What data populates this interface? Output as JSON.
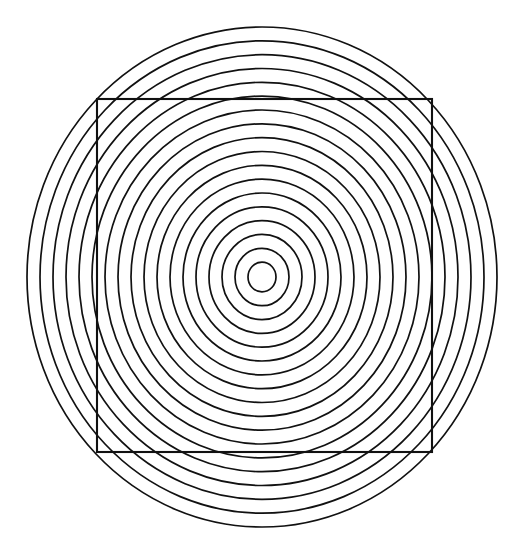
{
  "figure": {
    "background_color": "#ffffff",
    "stroke_color": "#111111",
    "canvas": {
      "width": 521,
      "height": 551
    }
  },
  "chart_data": {
    "type": "scatter",
    "subtitle": "",
    "xlabel": "",
    "ylabel": "",
    "xlim": [
      0,
      521
    ],
    "ylim": [
      0,
      551
    ],
    "grid": false,
    "legend": "none",
    "annotations": [],
    "center": {
      "x": 262,
      "y": 277
    },
    "ring_count": 18,
    "ring_stroke_width": 1.7,
    "rings": [
      {
        "index": 1,
        "rx": 14,
        "ry": 14.9
      },
      {
        "index": 2,
        "rx": 27,
        "ry": 28.7
      },
      {
        "index": 3,
        "rx": 40,
        "ry": 42.6
      },
      {
        "index": 4,
        "rx": 53,
        "ry": 56.4
      },
      {
        "index": 5,
        "rx": 66,
        "ry": 70.2
      },
      {
        "index": 6,
        "rx": 79,
        "ry": 84.0
      },
      {
        "index": 7,
        "rx": 92,
        "ry": 97.9
      },
      {
        "index": 8,
        "rx": 105,
        "ry": 111.7
      },
      {
        "index": 9,
        "rx": 118,
        "ry": 125.5
      },
      {
        "index": 10,
        "rx": 131,
        "ry": 139.4
      },
      {
        "index": 11,
        "rx": 144,
        "ry": 153.2
      },
      {
        "index": 12,
        "rx": 157,
        "ry": 167.0
      },
      {
        "index": 13,
        "rx": 170,
        "ry": 180.9
      },
      {
        "index": 14,
        "rx": 183,
        "ry": 194.7
      },
      {
        "index": 15,
        "rx": 196,
        "ry": 208.5
      },
      {
        "index": 16,
        "rx": 209,
        "ry": 222.3
      },
      {
        "index": 17,
        "rx": 222,
        "ry": 236.2
      },
      {
        "index": 18,
        "rx": 235,
        "ry": 250.0
      }
    ],
    "square": {
      "x": 97,
      "y": 99,
      "width": 335,
      "height": 353,
      "stroke_width": 2.1,
      "corners": {
        "top_left": {
          "x": 97,
          "y": 99
        },
        "top_right": {
          "x": 432,
          "y": 99
        },
        "bottom_right": {
          "x": 432,
          "y": 452
        },
        "bottom_left": {
          "x": 97,
          "y": 452
        }
      }
    }
  }
}
